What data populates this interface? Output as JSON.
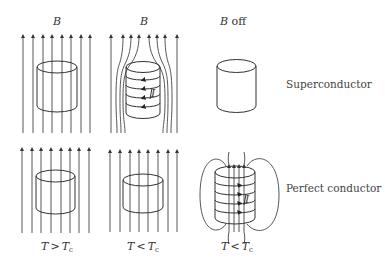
{
  "panels": {
    "top_left": {
      "label": "B",
      "state": "normal_field_through"
    },
    "top_middle": {
      "label": "B",
      "state": "field_expelled",
      "current_label": "I"
    },
    "top_right": {
      "label": "B off",
      "state": "no_field"
    },
    "bottom_left": {
      "label_T": "T",
      "label_op": ">",
      "label_Tc": "T",
      "label_sub": "c",
      "state": "normal_field_through"
    },
    "bottom_middle": {
      "label_T": "T",
      "label_op": "<",
      "label_Tc": "T",
      "label_sub": "c",
      "state": "field_through"
    },
    "bottom_right": {
      "label_T": "T",
      "label_op": "<",
      "label_Tc": "T",
      "label_sub": "c",
      "state": "trapped_flux",
      "current_label": "I"
    }
  },
  "row_labels": {
    "top": "Superconductor",
    "bottom": "Perfect conductor"
  },
  "colors": {
    "line": "#444444",
    "background": "#ffffff"
  }
}
